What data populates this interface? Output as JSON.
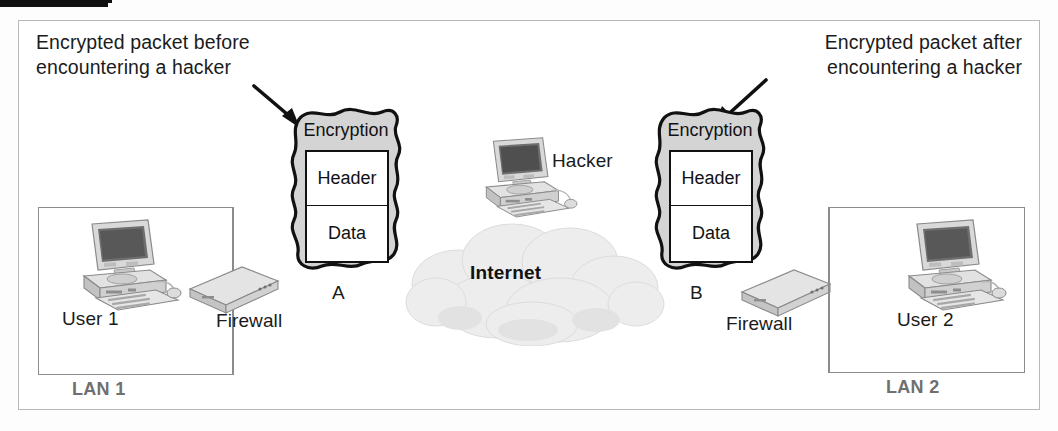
{
  "diagram": {
    "callouts": [
      {
        "id": "left",
        "text": "Encrypted packet before\nencountering a hacker"
      },
      {
        "id": "right",
        "text": "Encrypted packet after\nencountering a hacker"
      }
    ],
    "lans": [
      {
        "id": "lan1",
        "label": "LAN 1",
        "user_label": "User 1",
        "firewall_label": "Firewall"
      },
      {
        "id": "lan2",
        "label": "LAN 2",
        "user_label": "User 2",
        "firewall_label": "Firewall"
      }
    ],
    "cloud": {
      "label": "Internet"
    },
    "hacker": {
      "label": "Hacker"
    },
    "links": [
      {
        "id": "a",
        "label": "A"
      },
      {
        "id": "b",
        "label": "B"
      }
    ],
    "packets": [
      {
        "id": "packet-left",
        "title": "Encryption",
        "fields": [
          {
            "name": "header",
            "label": "Header"
          },
          {
            "name": "data",
            "label": "Data"
          }
        ]
      },
      {
        "id": "packet-right",
        "title": "Encryption",
        "fields": [
          {
            "name": "header",
            "label": "Header"
          },
          {
            "name": "data",
            "label": "Data"
          }
        ]
      }
    ],
    "icons": {
      "user1_computer": "desktop-computer-icon",
      "user2_computer": "desktop-computer-icon",
      "hacker_computer": "desktop-computer-icon",
      "firewall1": "firewall-appliance-icon",
      "firewall2": "firewall-appliance-icon",
      "cloud": "internet-cloud-icon",
      "arrow_left": "arrow-down-right-icon",
      "arrow_right": "arrow-down-left-icon"
    },
    "colors": {
      "frame_border": "#b9b9b9",
      "lan_border": "#8c8c8c",
      "lan_label": "#6f6f6f",
      "text": "#1b1b1b",
      "packet_fill": "#d4d4d4",
      "packet_stroke": "#111111",
      "cloud_fill": "#ededed",
      "wire": "#111111"
    }
  }
}
